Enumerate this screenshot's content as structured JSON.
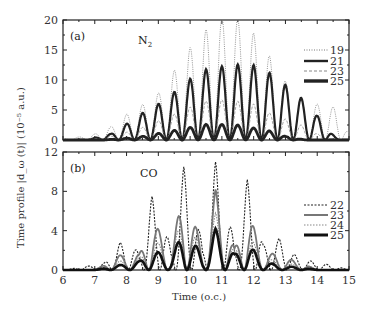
{
  "chart_data": [
    {
      "type": "line",
      "panel": "(a)",
      "annotation": "N2",
      "xlabel": "Time (o.c.)",
      "ylabel": "Time profile |d_ω(t)| (10^-5 a.u.)",
      "xlim": [
        6,
        15
      ],
      "ylim": [
        0,
        20
      ],
      "xticks": [
        6,
        7,
        8,
        9,
        10,
        11,
        12,
        13,
        14,
        15
      ],
      "yticks": [
        0,
        5,
        10,
        15,
        20
      ],
      "legend_position": "right",
      "series": [
        {
          "name": "19",
          "style": "dotted-thin",
          "peaks_x": [
            6.5,
            7.0,
            7.5,
            8.0,
            8.5,
            9.0,
            9.5,
            10.0,
            10.5,
            11.0,
            11.5,
            12.0,
            12.5,
            13.0,
            13.5,
            14.0,
            14.5
          ],
          "peaks_y": [
            0.5,
            1.0,
            2.2,
            4.3,
            5.9,
            7.8,
            11.6,
            15.4,
            18.4,
            20.5,
            20.3,
            17.8,
            14.0,
            9.8,
            7.0,
            6.0,
            5.5
          ]
        },
        {
          "name": "21",
          "style": "solid-thick",
          "peaks_x": [
            7.5,
            8.0,
            8.5,
            9.0,
            9.5,
            10.0,
            10.5,
            11.0,
            11.5,
            12.0,
            12.5,
            13.0,
            13.5,
            14.0
          ],
          "peaks_y": [
            1.0,
            2.7,
            4.5,
            6.0,
            8.0,
            10.2,
            11.8,
            12.3,
            12.6,
            12.5,
            11.2,
            9.2,
            7.0,
            4.0
          ]
        },
        {
          "name": "23",
          "style": "dashed-thin",
          "peaks_x": [
            7.5,
            8.0,
            8.5,
            9.0,
            9.5,
            10.0,
            10.5,
            11.0,
            11.5,
            12.0,
            12.5,
            13.0,
            13.5,
            14.0
          ],
          "peaks_y": [
            0.6,
            1.3,
            2.1,
            3.2,
            4.3,
            5.5,
            6.5,
            6.7,
            6.5,
            6.0,
            4.5,
            3.5,
            2.5,
            1.0
          ]
        },
        {
          "name": "25",
          "style": "solid-thicker",
          "peaks_x": [
            8.0,
            8.5,
            9.0,
            9.5,
            10.0,
            10.5,
            11.0,
            11.5,
            12.0,
            12.5,
            13.0
          ],
          "peaks_y": [
            0.3,
            0.6,
            1.1,
            1.6,
            2.1,
            2.6,
            2.6,
            2.5,
            2.0,
            1.5,
            0.6
          ]
        }
      ]
    },
    {
      "type": "line",
      "panel": "(b)",
      "annotation": "CO",
      "xlabel": "Time (o.c.)",
      "ylabel": "Time profile |d_ω(t)| (10^-5 a.u.)",
      "xlim": [
        6,
        15
      ],
      "ylim": [
        0,
        12
      ],
      "xticks": [
        6,
        7,
        8,
        9,
        10,
        11,
        12,
        13,
        14,
        15
      ],
      "yticks": [
        0,
        4,
        8,
        12
      ],
      "legend_position": "right",
      "series": [
        {
          "name": "22",
          "style": "dotted-dark",
          "peaks_x": [
            6.8,
            7.3,
            7.8,
            8.4,
            8.8,
            9.4,
            9.8,
            10.4,
            10.8,
            11.4,
            11.8,
            12.3,
            12.8,
            13.4,
            14.4
          ],
          "peaks_y": [
            0.4,
            0.7,
            2.8,
            1.9,
            7.5,
            2.4,
            10.5,
            2.5,
            11.0,
            2.7,
            9.2,
            2.5,
            3.2,
            1.2,
            0.5
          ]
        },
        {
          "name": "23",
          "style": "solid-gray",
          "peaks_x": [
            7.8,
            8.4,
            8.8,
            9.4,
            9.8,
            10.4,
            10.8,
            11.4,
            11.8,
            12.3,
            12.8,
            13.4
          ],
          "peaks_y": [
            1.5,
            1.6,
            5.2,
            2.0,
            8.2,
            2.2,
            8.2,
            2.2,
            6.0,
            1.9,
            1.5,
            0.8
          ]
        },
        {
          "name": "24",
          "style": "dotted-gray",
          "peaks_x": [
            7.8,
            8.4,
            8.8,
            9.4,
            9.8,
            10.4,
            10.8,
            11.4,
            11.8,
            12.3,
            12.8,
            13.4
          ],
          "peaks_y": [
            0.9,
            1.2,
            3.2,
            1.8,
            5.8,
            2.0,
            5.8,
            1.9,
            3.7,
            1.4,
            0.8,
            0.5
          ]
        },
        {
          "name": "25",
          "style": "solid-thick-black",
          "peaks_x": [
            7.8,
            8.4,
            8.8,
            9.4,
            9.8,
            10.4,
            10.8,
            11.4,
            11.8,
            12.3,
            12.8,
            13.4
          ],
          "peaks_y": [
            0.5,
            0.9,
            2.0,
            1.4,
            4.0,
            1.6,
            4.2,
            1.6,
            2.7,
            1.0,
            0.4,
            0.3
          ]
        }
      ]
    }
  ],
  "panel_a": {
    "label": "(a)",
    "molecule": "N",
    "molecule_sub": "2",
    "legend": [
      "19",
      "21",
      "23",
      "25"
    ],
    "yticks": [
      "0",
      "5",
      "10",
      "15",
      "20"
    ]
  },
  "panel_b": {
    "label": "(b)",
    "molecule": "CO",
    "legend": [
      "22",
      "23",
      "24",
      "25"
    ],
    "yticks": [
      "0",
      "4",
      "8",
      "12"
    ]
  },
  "x_axis": {
    "ticks": [
      "6",
      "7",
      "8",
      "9",
      "10",
      "11",
      "12",
      "13",
      "14",
      "15"
    ],
    "title": "Time (o.c.)"
  },
  "y_axis": {
    "title": "Time profile |d_ω (t)| (10⁻⁵ a.u.)"
  }
}
